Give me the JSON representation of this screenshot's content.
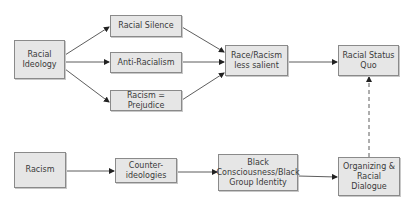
{
  "diagram": {
    "type": "flowchart",
    "nodes": [
      {
        "id": "racial_ideology",
        "label": "Racial\nIdeology"
      },
      {
        "id": "racial_silence",
        "label": "Racial Silence"
      },
      {
        "id": "anti_racialism",
        "label": "Anti-Racialism"
      },
      {
        "id": "racism_prejudice",
        "label": "Racism = Prejudice"
      },
      {
        "id": "less_salient",
        "label": "Race/Racism\nless salient"
      },
      {
        "id": "status_quo",
        "label": "Racial Status\nQuo"
      },
      {
        "id": "racism",
        "label": "Racism"
      },
      {
        "id": "counter_ideologies",
        "label": "Counter-\nideologies"
      },
      {
        "id": "black_consciousness",
        "label": "Black\nConsciousness/Black\nGroup Identity"
      },
      {
        "id": "organizing",
        "label": "Organizing &\nRacial Dialogue"
      }
    ],
    "edges": [
      {
        "from": "racial_ideology",
        "to": "racial_silence",
        "style": "solid"
      },
      {
        "from": "racial_ideology",
        "to": "anti_racialism",
        "style": "solid"
      },
      {
        "from": "racial_ideology",
        "to": "racism_prejudice",
        "style": "solid"
      },
      {
        "from": "racial_silence",
        "to": "less_salient",
        "style": "solid"
      },
      {
        "from": "anti_racialism",
        "to": "less_salient",
        "style": "solid"
      },
      {
        "from": "racism_prejudice",
        "to": "less_salient",
        "style": "solid"
      },
      {
        "from": "less_salient",
        "to": "status_quo",
        "style": "solid"
      },
      {
        "from": "racism",
        "to": "counter_ideologies",
        "style": "solid"
      },
      {
        "from": "counter_ideologies",
        "to": "black_consciousness",
        "style": "solid"
      },
      {
        "from": "black_consciousness",
        "to": "organizing",
        "style": "solid"
      },
      {
        "from": "organizing",
        "to": "status_quo",
        "style": "dashed"
      }
    ]
  },
  "colors": {
    "box_fill": "#e6e6e6",
    "box_border": "#8a8a8a",
    "line": "#333333",
    "text": "#3a3a3a"
  }
}
